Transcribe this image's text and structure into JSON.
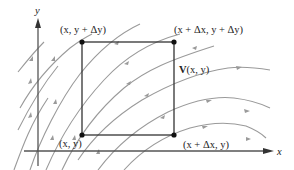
{
  "diagram": {
    "axes": {
      "x_label": "x",
      "y_label": "y"
    },
    "rectangle": {
      "corners": [
        {
          "id": "bottom-left",
          "label": "(x, y)"
        },
        {
          "id": "top-left",
          "label": "(x, y + Δy)"
        },
        {
          "id": "top-right",
          "label": "(x + Δx, y + Δy)"
        },
        {
          "id": "bottom-right",
          "label": "(x + Δx, y)"
        }
      ]
    },
    "field": {
      "label_bold": "V",
      "label_rest": "(x, y)",
      "description": "flow lines of vector field curving from lower-left up and to the right"
    },
    "colors": {
      "flow_lines": "#9a9a9a",
      "axes": "#555555",
      "rectangle": "#333333",
      "points": "#111111"
    }
  }
}
